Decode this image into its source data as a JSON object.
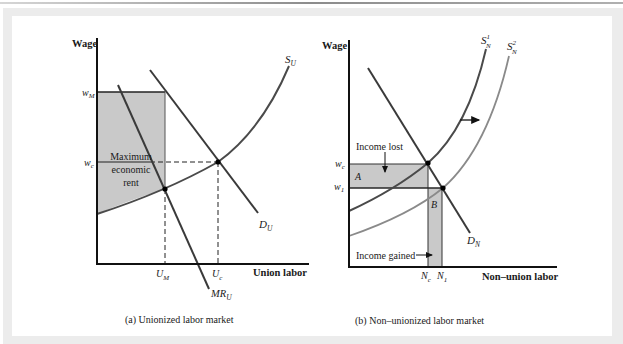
{
  "panel_a": {
    "y_axis_label": "Wage",
    "x_axis_label": "Union labor",
    "caption": "(a) Unionized labor market",
    "wage_ticks": {
      "w_M": "w",
      "w_M_sub": "M",
      "w_c": "w",
      "w_c_sub": "c"
    },
    "qty_ticks": {
      "U_M": "U",
      "U_M_sub": "M",
      "U_c": "U",
      "U_c_sub": "c"
    },
    "curves": {
      "supply": {
        "name": "S",
        "sub": "U"
      },
      "demand": {
        "name": "D",
        "sub": "U"
      },
      "marginal_revenue": {
        "name": "MR",
        "sub": "U"
      }
    },
    "shaded_area_label": [
      "Maximum",
      "economic",
      "rent"
    ]
  },
  "panel_b": {
    "y_axis_label": "Wage",
    "x_axis_label": "Non–union labor",
    "caption": "(b) Non–unionized labor market",
    "wage_ticks": {
      "w_c": "w",
      "w_c_sub": "c",
      "w_1": "w",
      "w_1_sub": "1"
    },
    "qty_ticks": {
      "N_c": "N",
      "N_c_sub": "c",
      "N_1": "N",
      "N_1_sub": "1"
    },
    "curves": {
      "supply_1": {
        "name": "S",
        "sub": "N",
        "sup": "1"
      },
      "supply_2": {
        "name": "S",
        "sub": "N",
        "sup": "2"
      },
      "demand": {
        "name": "D",
        "sub": "N"
      }
    },
    "area_labels": {
      "A": "A",
      "B": "B"
    },
    "annotations": {
      "income_lost": "Income lost",
      "income_gained": "Income gained"
    }
  },
  "colors": {
    "axis": "#111111",
    "line": "#3a3a3a",
    "supply_shifted": "#8a8a8a",
    "shade": "#c9c9c9",
    "frame": "#ececec"
  }
}
